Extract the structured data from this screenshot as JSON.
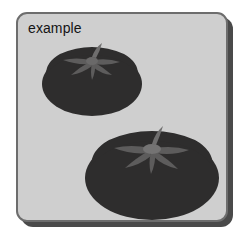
{
  "canvas": {
    "width": 247,
    "height": 246,
    "background_color": "#ffffff"
  },
  "card": {
    "label": "example",
    "background_color": "#cfcfcf",
    "border_color": "#6d6d6d",
    "shadow_color": "#4a4a4a",
    "corner_radius": "11px",
    "label_color": "#141414"
  },
  "objects": [
    {
      "name": "tomato",
      "position": "upper-left",
      "body_color": "#2e2d2d",
      "body_shadow_color": "#262525",
      "stem_color": "#5d5c5c",
      "stem_highlight_color": "#6f6e6e"
    },
    {
      "name": "tomato",
      "position": "lower-right",
      "body_color": "#2e2d2d",
      "body_shadow_color": "#262525",
      "stem_color": "#5d5c5c",
      "stem_highlight_color": "#6f6e6e"
    }
  ],
  "count": {
    "tomatoes": 2
  }
}
